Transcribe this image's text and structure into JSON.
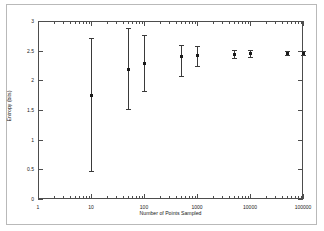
{
  "chart_data": {
    "type": "scatter",
    "title": "",
    "xlabel": "Number of Points Sampled",
    "ylabel": "Entropy (bits)",
    "xscale": "log",
    "yscale": "linear",
    "xlim": [
      1,
      100000
    ],
    "ylim": [
      0,
      3
    ],
    "grid": false,
    "legend": null,
    "xticks": [
      {
        "value": 1,
        "label": "1"
      },
      {
        "value": 10,
        "label": "10"
      },
      {
        "value": 100,
        "label": "100"
      },
      {
        "value": 1000,
        "label": "1000"
      },
      {
        "value": 10000,
        "label": "10000"
      },
      {
        "value": 100000,
        "label": "100000"
      }
    ],
    "yticks": [
      {
        "value": 0,
        "label": "0"
      },
      {
        "value": 0.5,
        "label": "0.5"
      },
      {
        "value": 1,
        "label": "1"
      },
      {
        "value": 1.5,
        "label": "1.5"
      },
      {
        "value": 2,
        "label": "2"
      },
      {
        "value": 2.5,
        "label": "2.5"
      },
      {
        "value": 3,
        "label": "3"
      }
    ],
    "series": [
      {
        "name": "Entropy estimate",
        "marker": "square",
        "color": "#1a1a1a",
        "points": [
          {
            "x": 10,
            "y": 1.74,
            "ylow": 0.48,
            "yhigh": 2.72
          },
          {
            "x": 50,
            "y": 2.19,
            "ylow": 1.51,
            "yhigh": 2.89
          },
          {
            "x": 100,
            "y": 2.28,
            "ylow": 1.82,
            "yhigh": 2.76
          },
          {
            "x": 500,
            "y": 2.4,
            "ylow": 2.08,
            "yhigh": 2.59
          },
          {
            "x": 1000,
            "y": 2.42,
            "ylow": 2.24,
            "yhigh": 2.58
          },
          {
            "x": 5000,
            "y": 2.44,
            "ylow": 2.37,
            "yhigh": 2.51
          },
          {
            "x": 10000,
            "y": 2.45,
            "ylow": 2.39,
            "yhigh": 2.51
          },
          {
            "x": 50000,
            "y": 2.46,
            "ylow": 2.43,
            "yhigh": 2.49
          },
          {
            "x": 100000,
            "y": 2.46,
            "ylow": 2.43,
            "yhigh": 2.49
          }
        ]
      }
    ]
  }
}
